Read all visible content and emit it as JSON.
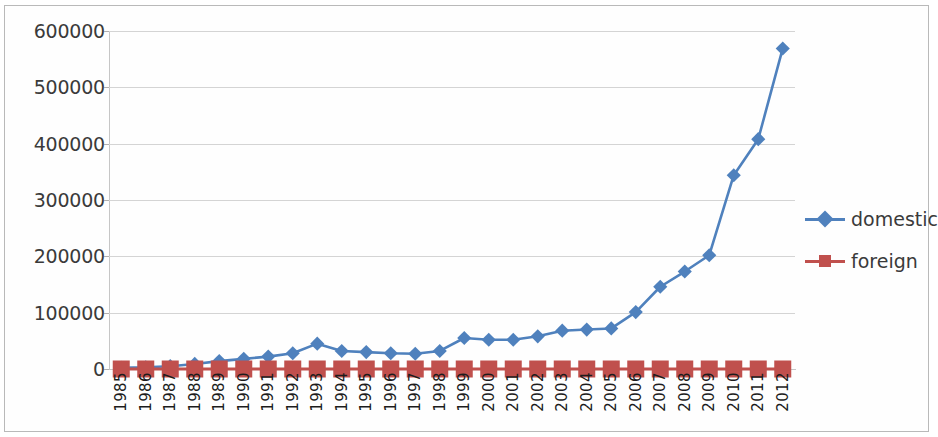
{
  "chart_data": {
    "type": "line",
    "title": "",
    "xlabel": "",
    "ylabel": "",
    "categories": [
      "1985",
      "1986",
      "1987",
      "1988",
      "1989",
      "1990",
      "1991",
      "1992",
      "1993",
      "1994",
      "1995",
      "1996",
      "1997",
      "1998",
      "1999",
      "2000",
      "2001",
      "2002",
      "2003",
      "2004",
      "2005",
      "2006",
      "2007",
      "2008",
      "2009",
      "2010",
      "2011",
      "2012"
    ],
    "ylim": [
      0,
      600000
    ],
    "ytick_labels": [
      "600000",
      "500000",
      "400000",
      "300000",
      "200000",
      "100000",
      "0"
    ],
    "ytick_values": [
      600000,
      500000,
      400000,
      300000,
      200000,
      100000,
      0
    ],
    "grid": true,
    "legend_position": "right",
    "series": [
      {
        "name": "domestic",
        "color": "#4F81BD",
        "marker": "diamond",
        "values": [
          2000,
          3000,
          5000,
          9000,
          14000,
          18000,
          22000,
          28000,
          45000,
          32000,
          30000,
          28000,
          27000,
          32000,
          55000,
          52000,
          52000,
          58000,
          68000,
          70000,
          72000,
          101000,
          146000,
          173000,
          202000,
          344000,
          408000,
          569000
        ]
      },
      {
        "name": "foreign",
        "color": "#C0504D",
        "marker": "square",
        "values": [
          0,
          0,
          0,
          0,
          0,
          0,
          0,
          0,
          0,
          0,
          0,
          0,
          0,
          0,
          0,
          0,
          0,
          0,
          0,
          0,
          0,
          0,
          0,
          0,
          0,
          0,
          0,
          0
        ]
      }
    ]
  },
  "legend": {
    "entries": [
      {
        "label": "domestic"
      },
      {
        "label": "foreign"
      }
    ]
  }
}
